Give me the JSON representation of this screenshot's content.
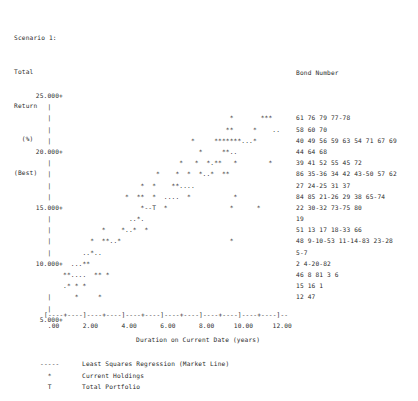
{
  "header": {
    "lines": [
      "Scenario 1:",
      "Total",
      "Return",
      "  (%)",
      "(Best)"
    ]
  },
  "bond_column": {
    "title": "Bond Number"
  },
  "x_axis": {
    "scale": "[----+----]----+----]----+----]----+----]----+----]----+----]--",
    "ticks": "  .00      2.00      4.00      6.00      8.00     10.00     12.00",
    "title": "Duration on Current Date (years)"
  },
  "legend": {
    "items": [
      {
        "mark": "-----",
        "label": "Least Squares Regression (Market Line)"
      },
      {
        "mark": "  *",
        "label": "Current Holdings"
      },
      {
        "mark": "  T",
        "label": "Total Portfolio"
      }
    ]
  },
  "chart_data": {
    "type": "scatter",
    "title": "Scenario 1: Total Return (%) (Best)",
    "xlabel": "Duration on Current Date (years)",
    "ylabel": "Total Return (%)",
    "xlim": [
      0.0,
      12.8
    ],
    "ylim": [
      5.0,
      25.0
    ],
    "grid": false,
    "legend_position": "below-plot-left",
    "y_ticks": [
      "25.000",
      "20.000",
      "15.000",
      "10.000",
      "5.000"
    ],
    "x_ticks": [
      ".00",
      "2.00",
      "4.00",
      "6.00",
      "8.00",
      "10.00",
      "12.00"
    ],
    "markers": {
      "data_point": "*",
      "regression_line": ".",
      "total_portfolio": "T"
    },
    "rows": [
      {
        "y_label": "25.000+",
        "plot": "                                                            ",
        "bonds": ""
      },
      {
        "y_label": "   |   ",
        "plot": "                                                            ",
        "bonds": ""
      },
      {
        "y_label": "   |   ",
        "plot": "                                           *       ***      ",
        "bonds": "61 76 79 77-78"
      },
      {
        "y_label": "   |   ",
        "plot": "                                          **     *    ..    ",
        "bonds": "58 60 70"
      },
      {
        "y_label": "   |   ",
        "plot": "                                 *     *******...*          ",
        "bonds": "40 49 56 59 63 54 71 67 69"
      },
      {
        "y_label": "20.000+",
        "plot": "                                   *     **..               ",
        "bonds": "44 64 68"
      },
      {
        "y_label": "   |   ",
        "plot": "                              *   *  *.**   *        *      ",
        "bonds": "39 41 52 55 45 72"
      },
      {
        "y_label": "   |   ",
        "plot": "                        *    *  *  *..*  **                 ",
        "bonds": "86 35-36 34 42 43-50 57 62"
      },
      {
        "y_label": "   |   ",
        "plot": "                    *  *    **....                          ",
        "bonds": "27 24-25 31 37"
      },
      {
        "y_label": "   |   ",
        "plot": "                *  **  *  ....  *           *               ",
        "bonds": "84 85 21-26 29 38 65-74"
      },
      {
        "y_label": "15.000+",
        "plot": "                    *--T  *                *      *         ",
        "bonds": "22 30-32 73-75 80"
      },
      {
        "y_label": "   |   ",
        "plot": "                 ..*.                                       ",
        "bonds": "19"
      },
      {
        "y_label": "   |   ",
        "plot": "          *    *..*  *                                      ",
        "bonds": "51 13 17 18-33 66"
      },
      {
        "y_label": "   |   ",
        "plot": "       *  **..*                            *                ",
        "bonds": "48 9-10-53 11-14-83 23-28"
      },
      {
        "y_label": "   |   ",
        "plot": "     ..*..                                                  ",
        "bonds": "5-7"
      },
      {
        "y_label": "10.000+",
        "plot": "  ...**                                                     ",
        "bonds": "2 4-20-82"
      },
      {
        "y_label": "       ",
        "plot": "**....  ** *                                                ",
        "bonds": "46 8 81 3 6"
      },
      {
        "y_label": "       ",
        "plot": ".* * *                                                      ",
        "bonds": "15 16 1"
      },
      {
        "y_label": "   |   ",
        "plot": "   *     *                                                  ",
        "bonds": "12 47"
      },
      {
        "y_label": "   |   ",
        "plot": "                                                            ",
        "bonds": ""
      },
      {
        "y_label": " 5.000+",
        "plot": "                                                            ",
        "bonds": ""
      }
    ]
  }
}
